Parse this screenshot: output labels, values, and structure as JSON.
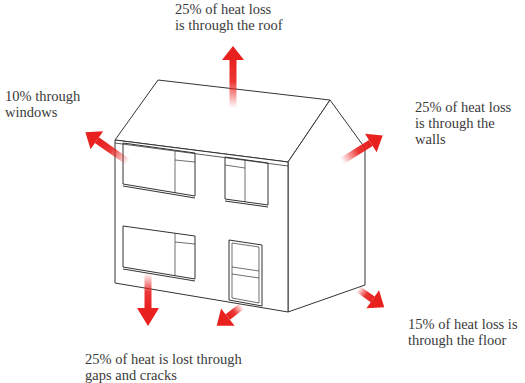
{
  "colors": {
    "arrow": "#e8201e",
    "outline": "#333333",
    "text": "#3a3a3a"
  },
  "labels": {
    "roof": [
      "25% of heat loss",
      "is through the roof"
    ],
    "windows": [
      "10% through",
      "windows"
    ],
    "walls": [
      "25% of heat loss",
      "is through the",
      "walls"
    ],
    "floor": [
      "15% of heat loss is",
      "through the floor"
    ],
    "gaps": [
      "25% of heat is lost through",
      "gaps and cracks"
    ]
  },
  "heat_loss": [
    {
      "part": "roof",
      "percent": 25
    },
    {
      "part": "windows",
      "percent": 10
    },
    {
      "part": "walls",
      "percent": 25
    },
    {
      "part": "floor",
      "percent": 15
    },
    {
      "part": "gaps",
      "percent": 25
    }
  ]
}
